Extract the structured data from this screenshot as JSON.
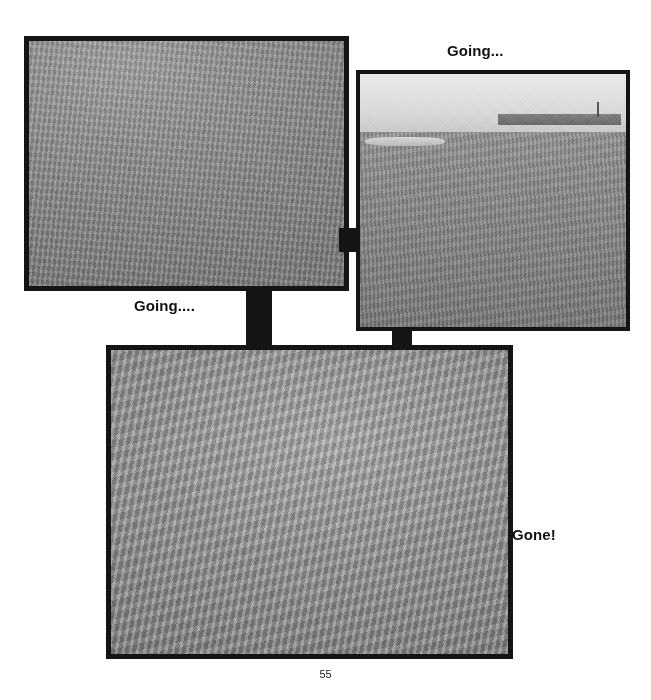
{
  "document": {
    "page_number": "55",
    "background_color": "#ffffff"
  },
  "captions": {
    "top_right": "Going...",
    "middle_left": "Going....",
    "bottom_right": "Gone!"
  },
  "photos": [
    {
      "id": "photo-running-dog",
      "caption_ref": "middle_left",
      "alt": "Black and white photograph of a greyhound running across wet sand with its shadow cast to the right",
      "frame_color": "#141414",
      "position": {
        "x": 24,
        "y": 36,
        "width": 325,
        "height": 255
      }
    },
    {
      "id": "photo-sitting-dog",
      "caption_ref": "top_right",
      "alt": "Black and white photograph of the same dog sitting on an open beach with the horizon and distant town visible",
      "frame_color": "#141414",
      "position": {
        "x": 356,
        "y": 70,
        "width": 274,
        "height": 261
      }
    },
    {
      "id": "photo-lying-dog",
      "caption_ref": "bottom_right",
      "alt": "Black and white photograph of the dog lying down flat on the sand, resting",
      "frame_color": "#141414",
      "position": {
        "x": 106,
        "y": 345,
        "width": 407,
        "height": 314
      }
    }
  ],
  "connectors": [
    {
      "id": "connector-photo1-photo2",
      "orientation": "horizontal",
      "x": 339,
      "y": 228,
      "width": 20,
      "height": 24
    },
    {
      "id": "connector-photo1-photo3",
      "orientation": "vertical",
      "x": 246,
      "y": 288,
      "width": 26,
      "height": 60
    },
    {
      "id": "connector-photo2-photo3",
      "orientation": "vertical",
      "x": 392,
      "y": 327,
      "width": 20,
      "height": 21
    }
  ],
  "colors": {
    "frame": "#141414",
    "text": "#111111",
    "page_background": "#ffffff",
    "sand_mid": "#8e8e8e",
    "sky": "#e4e4e4"
  }
}
